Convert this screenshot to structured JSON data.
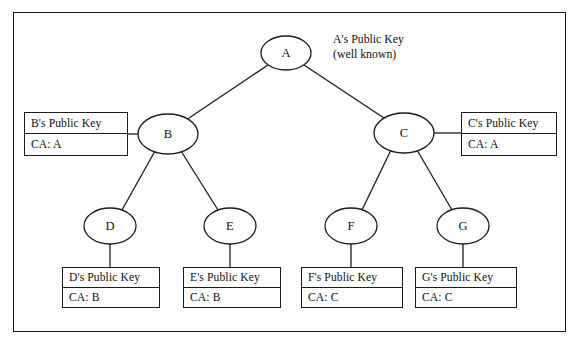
{
  "figure": {
    "kind": "certificate-authority-hierarchy-tree",
    "background_color": "#ffffff",
    "line_color": "#1b1b1b",
    "text_color": "#111111"
  },
  "root_annotation": {
    "line1": "A's Public Key",
    "line2": "(well known)"
  },
  "nodes": [
    {
      "id": "A",
      "label": "A",
      "cx": 286,
      "cy": 53,
      "rx": 25,
      "ry": 17
    },
    {
      "id": "B",
      "label": "B",
      "cx": 168,
      "cy": 134,
      "rx": 30,
      "ry": 20
    },
    {
      "id": "C",
      "label": "C",
      "cx": 404,
      "cy": 133,
      "rx": 30,
      "ry": 20
    },
    {
      "id": "D",
      "label": "D",
      "cx": 110,
      "cy": 226,
      "rx": 26,
      "ry": 18
    },
    {
      "id": "E",
      "label": "E",
      "cx": 230,
      "cy": 226,
      "rx": 26,
      "ry": 18
    },
    {
      "id": "F",
      "label": "F",
      "cx": 351,
      "cy": 226,
      "rx": 26,
      "ry": 18
    },
    {
      "id": "G",
      "label": "G",
      "cx": 463,
      "cy": 226,
      "rx": 26,
      "ry": 18
    }
  ],
  "edges": [
    {
      "from": "A",
      "to": "B",
      "x1": 268,
      "y1": 65,
      "x2": 186,
      "y2": 120
    },
    {
      "from": "A",
      "to": "C",
      "x1": 304,
      "y1": 65,
      "x2": 387,
      "y2": 120
    },
    {
      "from": "B",
      "to": "D",
      "x1": 155,
      "y1": 151,
      "x2": 122,
      "y2": 210
    },
    {
      "from": "B",
      "to": "E",
      "x1": 181,
      "y1": 151,
      "x2": 218,
      "y2": 210
    },
    {
      "from": "C",
      "to": "F",
      "x1": 391,
      "y1": 150,
      "x2": 362,
      "y2": 210
    },
    {
      "from": "C",
      "to": "G",
      "x1": 417,
      "y1": 150,
      "x2": 452,
      "y2": 210
    },
    {
      "from": "B",
      "to": "cert-B",
      "x1": 138,
      "y1": 134,
      "x2": 128,
      "y2": 134
    },
    {
      "from": "C",
      "to": "cert-C",
      "x1": 434,
      "y1": 133,
      "x2": 461,
      "y2": 133
    },
    {
      "from": "D",
      "to": "cert-D",
      "x1": 110,
      "y1": 244,
      "x2": 110,
      "y2": 267
    },
    {
      "from": "E",
      "to": "cert-E",
      "x1": 230,
      "y1": 244,
      "x2": 230,
      "y2": 267
    },
    {
      "from": "F",
      "to": "cert-F",
      "x1": 351,
      "y1": 244,
      "x2": 351,
      "y2": 267
    },
    {
      "from": "G",
      "to": "cert-G",
      "x1": 463,
      "y1": 244,
      "x2": 463,
      "y2": 267
    }
  ],
  "certificates": [
    {
      "id": "cert-B",
      "subject": "B's Public Key",
      "issuer": "CA: A",
      "x": 24,
      "y": 112,
      "w": 104,
      "h": 44
    },
    {
      "id": "cert-C",
      "subject": "C's Public Key",
      "issuer": "CA: A",
      "x": 461,
      "y": 112,
      "w": 96,
      "h": 44
    },
    {
      "id": "cert-D",
      "subject": "D's Public Key",
      "issuer": "CA: B",
      "x": 62,
      "y": 267,
      "w": 98,
      "h": 41
    },
    {
      "id": "cert-E",
      "subject": "E's Public Key",
      "issuer": "CA: B",
      "x": 183,
      "y": 267,
      "w": 98,
      "h": 41
    },
    {
      "id": "cert-F",
      "subject": "F's Public Key",
      "issuer": "CA: C",
      "x": 301,
      "y": 267,
      "w": 102,
      "h": 41
    },
    {
      "id": "cert-G",
      "subject": "G's Public Key",
      "issuer": "CA: C",
      "x": 415,
      "y": 267,
      "w": 102,
      "h": 41
    }
  ]
}
